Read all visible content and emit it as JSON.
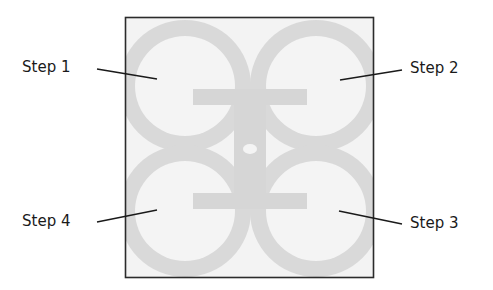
{
  "figure": {
    "frame": {
      "x": 125,
      "y": 17,
      "width": 249,
      "height": 261,
      "stroke": "#2b2b2b"
    },
    "colors": {
      "background": "#f3f3f3",
      "ring": "#d9d9d9",
      "lobe_fill": "#f4f4f4",
      "bar": "#d6d6d6",
      "leader": "#1a1a1a",
      "text": "#1a1a1a"
    },
    "steps": [
      {
        "id": 1,
        "label": "Step 1",
        "position": "top-left"
      },
      {
        "id": 2,
        "label": "Step 2",
        "position": "top-right"
      },
      {
        "id": 3,
        "label": "Step 3",
        "position": "bottom-right"
      },
      {
        "id": 4,
        "label": "Step 4",
        "position": "bottom-left"
      }
    ]
  }
}
